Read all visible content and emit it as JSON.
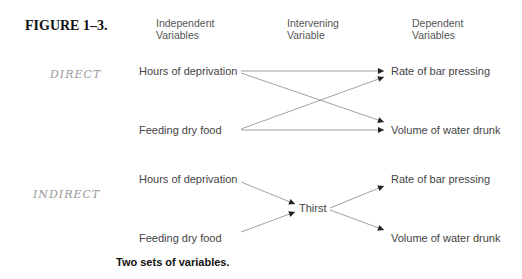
{
  "figure": {
    "label": "FIGURE 1–3.",
    "caption": "Two sets of variables."
  },
  "headers": {
    "independent": [
      "Independent",
      "Variables"
    ],
    "intervening": [
      "Intervening",
      "Variable"
    ],
    "dependent": [
      "Dependent",
      "Variables"
    ]
  },
  "direct_model": {
    "annotation": "DIRECT",
    "independent": [
      "Hours of deprivation",
      "Feeding dry food"
    ],
    "dependent": [
      "Rate of bar pressing",
      "Volume of water drunk"
    ],
    "edges": [
      [
        "Hours of deprivation",
        "Rate of bar pressing"
      ],
      [
        "Hours of deprivation",
        "Volume of water drunk"
      ],
      [
        "Feeding dry food",
        "Rate of bar pressing"
      ],
      [
        "Feeding dry food",
        "Volume of water drunk"
      ]
    ]
  },
  "indirect_model": {
    "annotation": "INDIRECT",
    "independent": [
      "Hours of deprivation",
      "Feeding dry food"
    ],
    "intervening": "Thirst",
    "dependent": [
      "Rate of bar pressing",
      "Volume of water drunk"
    ],
    "edges": [
      [
        "Hours of deprivation",
        "Thirst"
      ],
      [
        "Feeding dry food",
        "Thirst"
      ],
      [
        "Thirst",
        "Rate of bar pressing"
      ],
      [
        "Thirst",
        "Volume of water drunk"
      ]
    ]
  },
  "colors": {
    "line": "#888888",
    "arrowhead": "#222222",
    "text": "#444444"
  }
}
